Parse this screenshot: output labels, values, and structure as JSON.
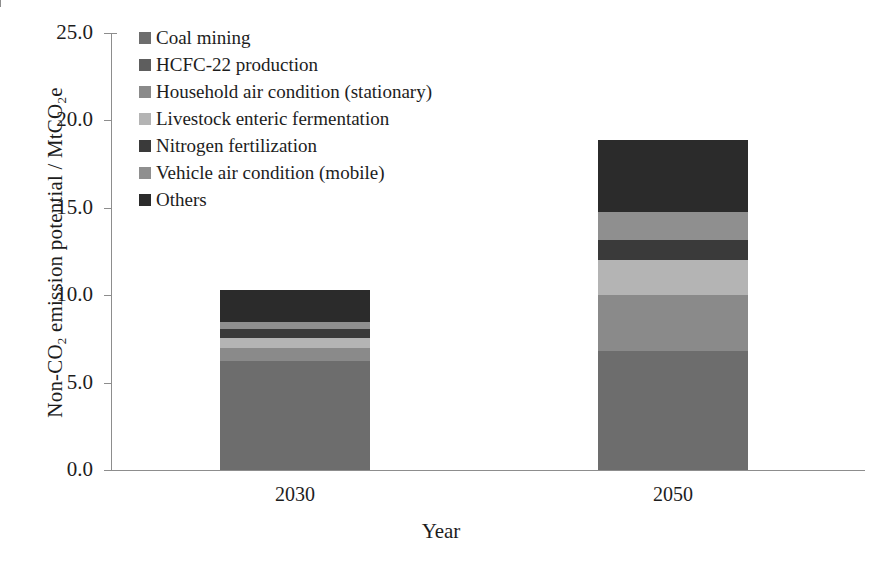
{
  "chart_data": {
    "type": "bar",
    "stacked": true,
    "title": "",
    "xlabel": "Year",
    "ylabel": "Non-CO2 emission potential / MtCO2e",
    "ylabel_parts": {
      "prefix": "Non-CO",
      "sub1": "2",
      "middle": " emission potential / MtCO",
      "sub2": "2",
      "suffix": "e"
    },
    "categories": [
      "2030",
      "2050"
    ],
    "ylim": [
      0,
      25
    ],
    "ytick_values": [
      0,
      5,
      10,
      15,
      20,
      25
    ],
    "ytick_labels": [
      "0.0",
      "5.0",
      "10.0",
      "15.0",
      "20.0",
      "25.0"
    ],
    "grid": false,
    "legend_position": "top-left",
    "series": [
      {
        "name": "Coal mining",
        "color": "#6d6d6d",
        "values": [
          6.25,
          6.8
        ]
      },
      {
        "name": "HCFC-22 production",
        "color": "#5e5e5e",
        "values": [
          0.0,
          0.0
        ]
      },
      {
        "name": "Household air condition (stationary)",
        "color": "#8a8a8a",
        "values": [
          0.75,
          3.2
        ]
      },
      {
        "name": "Livestock enteric fermentation",
        "color": "#b4b4b4",
        "values": [
          0.57,
          2.0
        ]
      },
      {
        "name": "Nitrogen fertilization",
        "color": "#3a3a3a",
        "values": [
          0.52,
          1.15
        ]
      },
      {
        "name": "Vehicle air condition (mobile)",
        "color": "#8f8f8f",
        "values": [
          0.4,
          1.6
        ]
      },
      {
        "name": "Others",
        "color": "#2b2b2b",
        "values": [
          1.83,
          4.15
        ]
      }
    ],
    "totals": [
      10.32,
      18.9
    ],
    "legend_order": [
      "Coal mining",
      "HCFC-22 production",
      "Household air condition (stationary)",
      "Livestock enteric fermentation",
      "Nitrogen fertilization",
      "Vehicle air condition (mobile)",
      "Others"
    ]
  },
  "axis_color": "#8d8d8d"
}
